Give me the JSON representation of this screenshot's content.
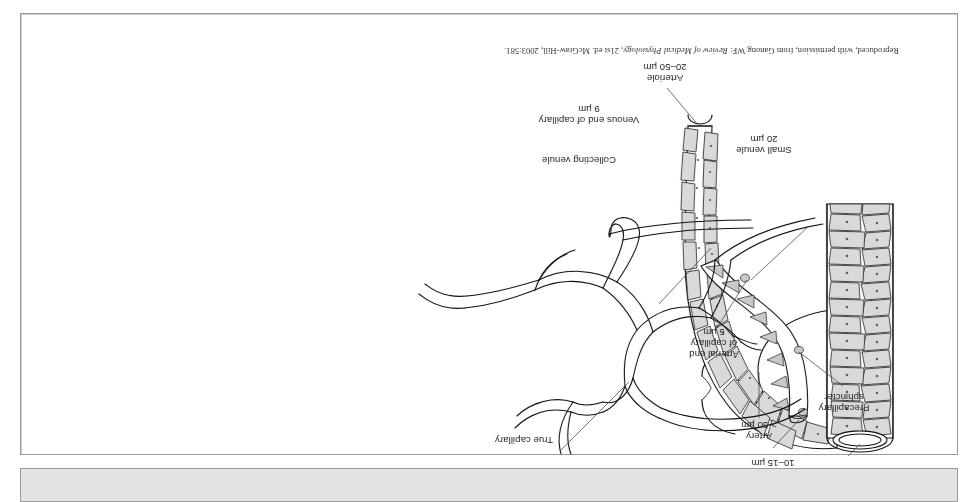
{
  "figure": {
    "kind": "anatomical-illustration",
    "orientation_note": "Illustration is printed rotated 180 degrees (upside down) in the scan",
    "credit": {
      "prefix": "Reproduced, with permission, from Ganong WF: ",
      "work_italic": "Review of Medical Physiology",
      "suffix": ", 21st ed. McGraw-Hill, 2003:581."
    },
    "labels": [
      {
        "id": "arteriole",
        "name": "Arteriole",
        "size": "20–50 µm"
      },
      {
        "id": "metarteriole",
        "name": "Metarteriole",
        "size": "10–15 µm"
      },
      {
        "id": "true-capillary",
        "name": "True capillary",
        "size": ""
      },
      {
        "id": "small-venule",
        "name": "Small venule",
        "size": "20 µm"
      },
      {
        "id": "collecting-venule",
        "name": "Collecting venule",
        "size": ""
      },
      {
        "id": "venous-end",
        "name": "Venous end of capillary",
        "size": "9 µm"
      },
      {
        "id": "arterial-end",
        "name": "Arterial end\nof capillary",
        "size": "5 µm"
      },
      {
        "id": "precap-sphincter",
        "name": "Precapillary\nsphincter",
        "size": ""
      },
      {
        "id": "artery",
        "name": "Artery",
        "size": "> 50 µm"
      }
    ],
    "label_text": {
      "arteriole_name": "Arteriole",
      "arteriole_size": "20–50 µm",
      "metarteriole_name": "Metarteriole",
      "metarteriole_size": "10–15 µm",
      "true_capillary_name": "True capillary",
      "small_venule_name": "Small venule",
      "small_venule_size": "20 µm",
      "collecting_venule_name": "Collecting venule",
      "venous_end_name": "Venous end of capillary",
      "venous_end_size": "9 µm",
      "arterial_end_l1": "Arterial end",
      "arterial_end_l2": "of capillary",
      "arterial_end_size": "5 µm",
      "precap_l1": "Precapillary",
      "precap_l2": "sphincter",
      "artery_name": "Artery",
      "artery_size": "> 50 µm"
    },
    "colors": {
      "ink": "#111111",
      "cell_fill": "#d9d9d9",
      "muscle_fill": "#c9c9c9",
      "panel_border": "#9a9a9a",
      "bottom_bar": "#e3e3e3",
      "page_background": "#ffffff"
    }
  }
}
